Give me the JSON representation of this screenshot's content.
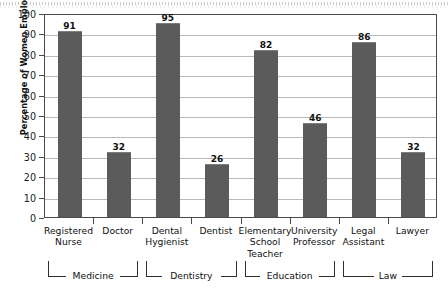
{
  "chart_data": {
    "type": "bar",
    "title": "",
    "xlabel": "",
    "ylabel": "Percentage of Women Employed",
    "ylim": [
      0,
      100
    ],
    "ytick_step": 10,
    "grid": "horizontal",
    "legend": "none",
    "bar_color": "#5b5b5b",
    "categories": [
      "Registered\nNurse",
      "Doctor",
      "Dental\nHygienist",
      "Dentist",
      "Elementary\nSchool\nTeacher",
      "University\nProfessor",
      "Legal\nAssistant",
      "Lawyer"
    ],
    "values": [
      91,
      32,
      95,
      26,
      82,
      46,
      86,
      32
    ],
    "ytick_labels": [
      "100",
      "90",
      "80",
      "70",
      "60",
      "50",
      "40",
      "30",
      "20",
      "10",
      "0"
    ],
    "groups": [
      {
        "label": "Medicine",
        "start_index": 0,
        "end_index": 1
      },
      {
        "label": "Dentistry",
        "start_index": 2,
        "end_index": 3
      },
      {
        "label": "Education",
        "start_index": 4,
        "end_index": 5
      },
      {
        "label": "Law",
        "start_index": 6,
        "end_index": 7
      }
    ]
  }
}
